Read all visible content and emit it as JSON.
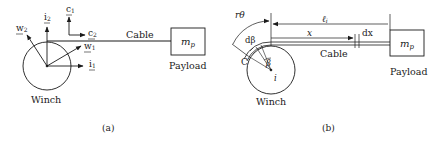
{
  "figure_a": {
    "caption": "(a)",
    "winch_label": "Winch",
    "cable_label": "Cable",
    "payload_label": "Payload",
    "mass_label": "m",
    "mass_sub": "p",
    "vectors": {
      "w2": {
        "base": "w",
        "sub": "2"
      },
      "i2": {
        "base": "i",
        "sub": "2"
      },
      "c1": {
        "base": "c",
        "sub": "1"
      },
      "c2": {
        "base": "c",
        "sub": "2"
      },
      "w1": {
        "base": "w",
        "sub": "1"
      },
      "i1": {
        "base": "i",
        "sub": "1"
      }
    }
  },
  "figure_b": {
    "caption": "(b)",
    "winch_label": "Winch",
    "cable_label": "Cable",
    "payload_label": "Payload",
    "mass_label": "m",
    "mass_sub": "p",
    "arc_label": "rθ",
    "length_label": "ℓ",
    "length_sub": "i",
    "x_label": "x",
    "dx_label": "dx",
    "dbeta_label": "dβ",
    "beta_label": "β",
    "contact_label": "C",
    "center_label": "i"
  },
  "colors": {
    "stroke": "#1a1a1a",
    "background": "#ffffff"
  }
}
